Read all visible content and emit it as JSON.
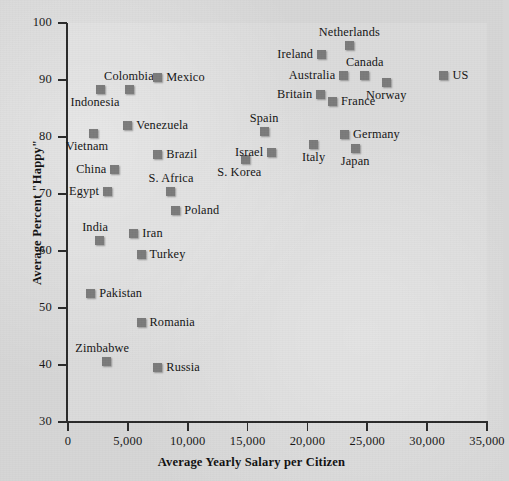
{
  "chart_data": {
    "type": "scatter",
    "title": "",
    "xlabel": "Average Yearly Salary per Citizen",
    "ylabel": "Average Percent \"Happy\"",
    "xlim": [
      0,
      35000
    ],
    "ylim": [
      30,
      100
    ],
    "xticks": [
      0,
      5000,
      10000,
      15000,
      20000,
      25000,
      30000,
      35000
    ],
    "xticklabels": [
      "0",
      "5,000",
      "10,000",
      "15,000",
      "20,000",
      "25,000",
      "30,000",
      "35,000"
    ],
    "yticks": [
      30,
      40,
      50,
      60,
      70,
      80,
      90,
      100
    ],
    "yticklabels": [
      "30",
      "40",
      "50",
      "60",
      "70",
      "80",
      "90",
      "100"
    ],
    "grid": false,
    "legend": false,
    "marker_color": "#7b7b7b",
    "marker_shape": "square",
    "points": [
      {
        "label": "Indonesia",
        "x": 2750,
        "y": 88.4,
        "label_pos": "below-left"
      },
      {
        "label": "Colombia",
        "x": 5100,
        "y": 88.4,
        "label_pos": "above"
      },
      {
        "label": "Mexico",
        "x": 7500,
        "y": 90.4,
        "label_pos": "right"
      },
      {
        "label": "Venezuela",
        "x": 5000,
        "y": 82.1,
        "label_pos": "right"
      },
      {
        "label": "Vietnam",
        "x": 2100,
        "y": 80.7,
        "label_pos": "below-left"
      },
      {
        "label": "Brazil",
        "x": 7500,
        "y": 77.0,
        "label_pos": "right"
      },
      {
        "label": "China",
        "x": 3900,
        "y": 74.3,
        "label_pos": "left"
      },
      {
        "label": "Egypt",
        "x": 3300,
        "y": 70.5,
        "label_pos": "left"
      },
      {
        "label": "S. Africa",
        "x": 8600,
        "y": 70.5,
        "label_pos": "above"
      },
      {
        "label": "Poland",
        "x": 9000,
        "y": 67.1,
        "label_pos": "right"
      },
      {
        "label": "India",
        "x": 2600,
        "y": 61.8,
        "label_pos": "above-left"
      },
      {
        "label": "Iran",
        "x": 5500,
        "y": 63.0,
        "label_pos": "right"
      },
      {
        "label": "Turkey",
        "x": 6100,
        "y": 59.3,
        "label_pos": "right"
      },
      {
        "label": "Pakistan",
        "x": 1900,
        "y": 52.5,
        "label_pos": "right"
      },
      {
        "label": "Romania",
        "x": 6100,
        "y": 47.5,
        "label_pos": "right"
      },
      {
        "label": "Zimbabwe",
        "x": 3200,
        "y": 40.6,
        "label_pos": "above-left"
      },
      {
        "label": "Russia",
        "x": 7500,
        "y": 39.5,
        "label_pos": "right"
      },
      {
        "label": "S. Korea",
        "x": 14800,
        "y": 76.0,
        "label_pos": "below-left"
      },
      {
        "label": "Israel",
        "x": 17000,
        "y": 77.3,
        "label_pos": "left"
      },
      {
        "label": "Spain",
        "x": 16400,
        "y": 80.9,
        "label_pos": "above"
      },
      {
        "label": "Italy",
        "x": 20500,
        "y": 78.6,
        "label_pos": "below"
      },
      {
        "label": "Germany",
        "x": 23100,
        "y": 80.5,
        "label_pos": "right"
      },
      {
        "label": "Japan",
        "x": 24000,
        "y": 78.0,
        "label_pos": "below"
      },
      {
        "label": "Britain",
        "x": 21100,
        "y": 87.5,
        "label_pos": "left"
      },
      {
        "label": "France",
        "x": 22100,
        "y": 86.3,
        "label_pos": "right"
      },
      {
        "label": "Australia",
        "x": 23000,
        "y": 90.8,
        "label_pos": "left"
      },
      {
        "label": "Canada",
        "x": 24800,
        "y": 90.8,
        "label_pos": "above"
      },
      {
        "label": "Norway",
        "x": 26600,
        "y": 89.5,
        "label_pos": "below"
      },
      {
        "label": "Ireland",
        "x": 21200,
        "y": 94.5,
        "label_pos": "left"
      },
      {
        "label": "Netherlands",
        "x": 23500,
        "y": 96.0,
        "label_pos": "above"
      },
      {
        "label": "US",
        "x": 31400,
        "y": 90.8,
        "label_pos": "right"
      }
    ]
  }
}
